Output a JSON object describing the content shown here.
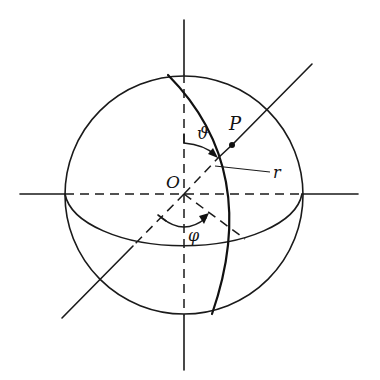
{
  "diagram": {
    "labels": {
      "origin": "O",
      "point": "P",
      "radius": "r",
      "polar_angle": "ϑ",
      "azimuth_angle": "φ"
    },
    "colors": {
      "ink": "#1a1a1a",
      "background": "#ffffff"
    }
  }
}
